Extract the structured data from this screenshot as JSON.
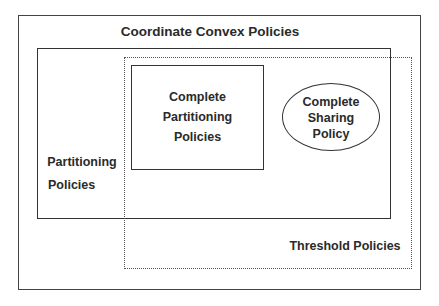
{
  "diagram": {
    "outer": {
      "label": "Coordinate Convex Policies"
    },
    "partitioning": {
      "line1": "Partitioning",
      "line2": "Policies"
    },
    "complete_partitioning": {
      "line1": "Complete",
      "line2": "Partitioning",
      "line3": "Policies"
    },
    "complete_sharing": {
      "line1": "Complete",
      "line2": "Sharing",
      "line3": "Policy"
    },
    "threshold": {
      "label": "Threshold Policies"
    }
  }
}
